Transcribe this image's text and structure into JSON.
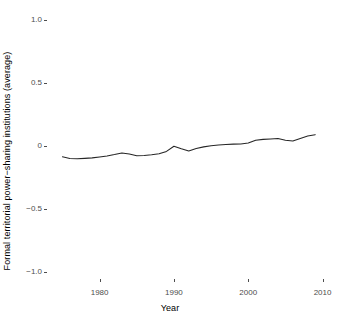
{
  "chart_data": {
    "type": "line",
    "title": "",
    "xlabel": "Year",
    "ylabel": "Formal territorial power−sharing institutions (average)",
    "xlim": [
      1974,
      2011
    ],
    "ylim": [
      -1.08,
      1.08
    ],
    "grid": false,
    "legend": null,
    "xticks": [
      1980,
      1990,
      2000,
      2010
    ],
    "xtick_labels": [
      "1980",
      "1990",
      "2000",
      "2010"
    ],
    "yticks": [
      1.0,
      0.5,
      0,
      -0.5,
      -1.0
    ],
    "ytick_labels": [
      "1.0",
      "0.5",
      "0",
      "−0.5",
      "−1.0"
    ],
    "line_color": "#262626",
    "series": [
      {
        "name": "Formal territorial power-sharing institutions (average)",
        "x": [
          1975,
          1976,
          1977,
          1978,
          1979,
          1980,
          1981,
          1982,
          1983,
          1984,
          1985,
          1986,
          1987,
          1988,
          1989,
          1990,
          1991,
          1992,
          1993,
          1994,
          1995,
          1996,
          1997,
          1998,
          1999,
          2000,
          2001,
          2002,
          2003,
          2004,
          2005,
          2006,
          2007,
          2008,
          2009
        ],
        "y": [
          -0.086,
          -0.099,
          -0.101,
          -0.098,
          -0.094,
          -0.087,
          -0.079,
          -0.068,
          -0.055,
          -0.064,
          -0.078,
          -0.076,
          -0.07,
          -0.062,
          -0.043,
          -0.002,
          -0.022,
          -0.04,
          -0.02,
          -0.007,
          0.002,
          0.008,
          0.012,
          0.015,
          0.016,
          0.024,
          0.046,
          0.053,
          0.056,
          0.06,
          0.046,
          0.04,
          0.06,
          0.08,
          0.09
        ]
      }
    ]
  },
  "axes": {
    "x_title": "Year",
    "y_title": "Formal territorial power−sharing institutions (average)"
  },
  "ticks": {
    "y": [
      {
        "label": "1.0",
        "value": 1.0
      },
      {
        "label": "0.5",
        "value": 0.5
      },
      {
        "label": "0",
        "value": 0
      },
      {
        "label": "−0.5",
        "value": -0.5
      },
      {
        "label": "−1.0",
        "value": -1.0
      }
    ],
    "x": [
      {
        "label": "1980",
        "value": 1980
      },
      {
        "label": "1990",
        "value": 1990
      },
      {
        "label": "2000",
        "value": 2000
      },
      {
        "label": "2010",
        "value": 2010
      }
    ]
  }
}
